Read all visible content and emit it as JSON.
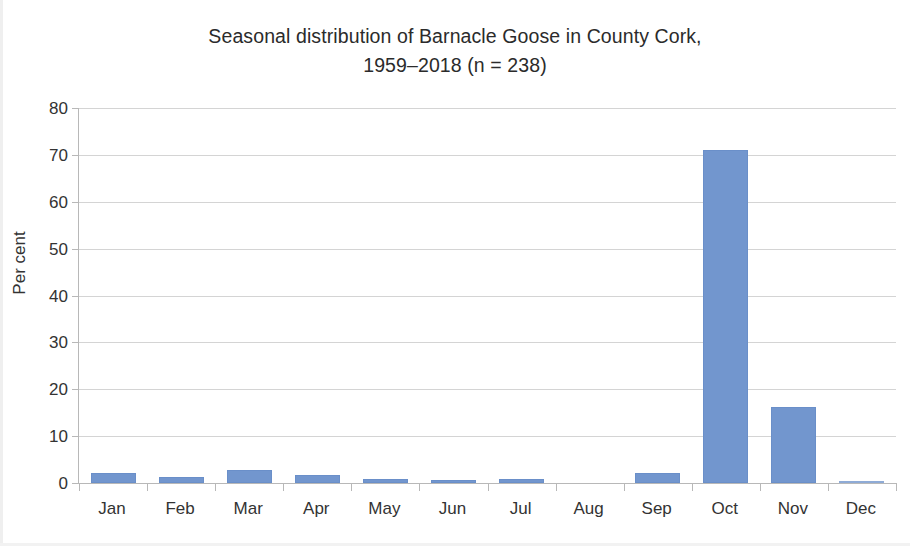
{
  "chart_data": {
    "type": "bar",
    "title_lines": [
      "Seasonal distribution of Barnacle Goose in County Cork,",
      "1959–2018 (n = 238)"
    ],
    "title": "Seasonal distribution of Barnacle Goose in County Cork, 1959–2018 (n = 238)",
    "subtitle": "",
    "xlabel": "",
    "ylabel": "Per cent",
    "categories": [
      "Jan",
      "Feb",
      "Mar",
      "Apr",
      "May",
      "Jun",
      "Jul",
      "Aug",
      "Sep",
      "Oct",
      "Nov",
      "Dec"
    ],
    "values": [
      2.1,
      1.2,
      2.8,
      1.7,
      0.8,
      0.7,
      0.8,
      0.0,
      2.1,
      71.0,
      16.3,
      0.4
    ],
    "ylim": [
      0,
      80
    ],
    "ytick_labels": [
      "80",
      "70",
      "60",
      "50",
      "40",
      "30",
      "20",
      "10",
      "0"
    ],
    "yticks": [
      80,
      70,
      60,
      50,
      40,
      30,
      20,
      10,
      0
    ],
    "grid": "horizontal",
    "legend": "none",
    "bar_color": "#7296CE",
    "gridline_color": "#D4D4D4",
    "axis_color": "#B8B8B8",
    "text_color": "#333333",
    "background": "#FFFFFF",
    "n": 238,
    "period": "1959–2018",
    "species": "Barnacle Goose",
    "region": "County Cork"
  }
}
